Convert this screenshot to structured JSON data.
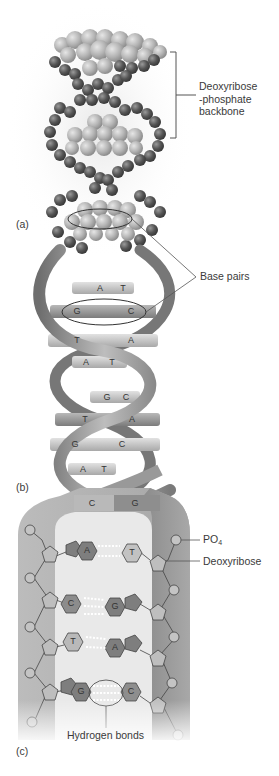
{
  "figure": {
    "panels": [
      {
        "id": "a",
        "label": "(a)",
        "type": "space-filling model"
      },
      {
        "id": "b",
        "label": "(b)",
        "type": "ribbon helix model"
      },
      {
        "id": "c",
        "label": "(c)",
        "type": "chemical schematic"
      }
    ],
    "callouts": {
      "backbone": "Deoxyribose\n-phosphate\nbackbone",
      "backbone_lines": [
        "Deoxyribose",
        "-phosphate",
        "backbone"
      ],
      "base_pairs": "Base pairs",
      "po4_main": "PO",
      "po4_sub": "4",
      "deoxyribose": "Deoxyribose",
      "hydrogen_bonds": "Hydrogen bonds"
    },
    "helix_base_pairs": [
      {
        "left": "A",
        "right": "T"
      },
      {
        "left": "G",
        "right": "C"
      },
      {
        "left": "T",
        "right": "A"
      },
      {
        "left": "A",
        "right": "T"
      },
      {
        "left": "G",
        "right": "C"
      },
      {
        "left": "T",
        "right": "A"
      },
      {
        "left": "G",
        "right": "C"
      },
      {
        "left": "A",
        "right": "T"
      },
      {
        "left": "C",
        "right": "G"
      }
    ],
    "schematic_base_pairs": [
      {
        "left": "A",
        "right": "T"
      },
      {
        "left": "C",
        "right": "G"
      },
      {
        "left": "T",
        "right": "A"
      },
      {
        "left": "G",
        "right": "C"
      }
    ],
    "colors": {
      "dark_atom": "#5a5a5a",
      "light_atom": "#b8b8b8",
      "ribbon": "#8c8c8c",
      "ribbon_light": "#c4c4c4",
      "purine": "#7d7d7d",
      "pyrimidine": "#bdbdbd",
      "backbone_band": "#9a9a9a"
    }
  }
}
